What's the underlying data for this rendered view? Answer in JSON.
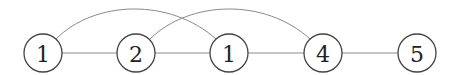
{
  "diagram": {
    "type": "graph",
    "nodes": [
      {
        "id": "n1",
        "label": "1",
        "x": 43,
        "y": 53
      },
      {
        "id": "n2",
        "label": "2",
        "x": 136,
        "y": 53
      },
      {
        "id": "n3",
        "label": "1",
        "x": 229,
        "y": 53
      },
      {
        "id": "n4",
        "label": "4",
        "x": 323,
        "y": 53
      },
      {
        "id": "n5",
        "label": "5",
        "x": 417,
        "y": 53
      }
    ],
    "edges": [
      {
        "from": "n1",
        "to": "n2",
        "style": "straight"
      },
      {
        "from": "n2",
        "to": "n3",
        "style": "straight"
      },
      {
        "from": "n3",
        "to": "n4",
        "style": "straight"
      },
      {
        "from": "n4",
        "to": "n5",
        "style": "straight"
      },
      {
        "from": "n1",
        "to": "n3",
        "style": "arc"
      },
      {
        "from": "n2",
        "to": "n4",
        "style": "arc"
      }
    ]
  }
}
